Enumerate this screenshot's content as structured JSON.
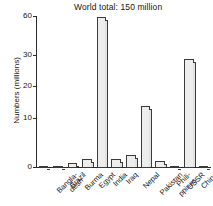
{
  "chart_data": {
    "type": "bar",
    "title": "World total:  150 million",
    "xlabel": "",
    "ylabel": "Numbers (millions)",
    "categories": [
      "Bangla-desh",
      "Brazil",
      "Burma",
      "Egypt",
      "India",
      "Iraq",
      "Nepal",
      "Pakistan",
      "Phili-ppines",
      "USSR",
      "China",
      "Italy"
    ],
    "category_lines": [
      [
        "Bangla-",
        "desh"
      ],
      [
        "Brazil"
      ],
      [
        "Burma"
      ],
      [
        "Egypt"
      ],
      [
        "India"
      ],
      [
        "Iraq"
      ],
      [
        "Nepal"
      ],
      [
        "Pakistan"
      ],
      [
        "Phili-",
        "ppines"
      ],
      [
        "USSR"
      ],
      [
        "China"
      ],
      [
        "Italy"
      ]
    ],
    "values": [
      0.4,
      0.3,
      1.0,
      1.8,
      60.0,
      1.8,
      2.6,
      14.0,
      1.5,
      0.5,
      29.0,
      0.2
    ],
    "yticks": [
      0,
      10,
      20,
      30,
      60
    ],
    "ytick_labels": [
      "0",
      "10",
      "20",
      "30",
      "60"
    ],
    "ylim": [
      0,
      60
    ],
    "axis_break": true,
    "grid": false,
    "legend": "none",
    "bar_fill": "#ededed",
    "bar_edge": "#3a3a3a"
  },
  "annotations": {
    "world_total_note": "World total:  150 million"
  }
}
